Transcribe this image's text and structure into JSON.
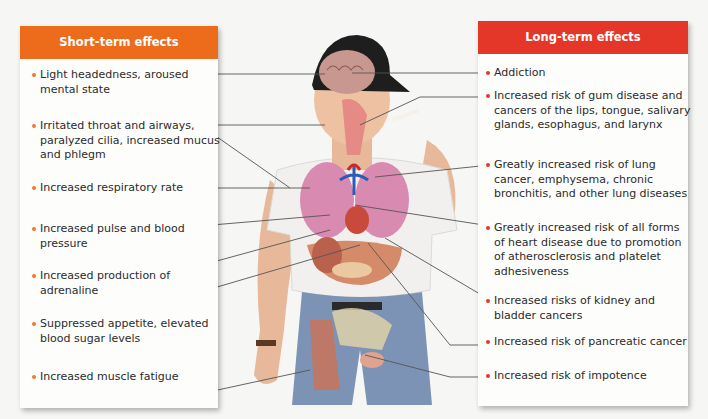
{
  "colors": {
    "short_term_header": "#ec6c1c",
    "long_term_header": "#e4372a",
    "panel_background": "#fdfdfc",
    "page_background": "#f6f6f5",
    "text": "#2b2b2b"
  },
  "short_term": {
    "title": "Short-term effects",
    "items": [
      {
        "label": "Light headedness, aroused mental state",
        "organ": "brain"
      },
      {
        "label": "Irritated throat and airways, paralyzed cilia, increased mucus and phlegm",
        "organ": "throat-airways"
      },
      {
        "label": "Increased respiratory rate",
        "organ": "lungs"
      },
      {
        "label": "Increased pulse and blood pressure",
        "organ": "heart"
      },
      {
        "label": "Increased production of adrenaline",
        "organ": "adrenal-glands"
      },
      {
        "label": "Suppressed appetite, elevated blood sugar levels",
        "organ": "stomach"
      },
      {
        "label": "Increased muscle fatigue",
        "organ": "muscles"
      }
    ]
  },
  "long_term": {
    "title": "Long-term effects",
    "items": [
      {
        "label": "Addiction",
        "organ": "brain"
      },
      {
        "label": "Increased risk of gum disease and cancers of the lips, tongue, salivary glands, esophagus, and larynx",
        "organ": "mouth"
      },
      {
        "label": "Greatly increased risk of lung cancer, emphysema, chronic bronchitis, and other lung diseases",
        "organ": "lungs"
      },
      {
        "label": "Greatly increased risk of all forms of heart disease due to promotion of atherosclerosis and platelet adhesiveness",
        "organ": "heart"
      },
      {
        "label": "Increased risks of kidney and bladder cancers",
        "organ": "kidney"
      },
      {
        "label": "Increased risk of pancreatic cancer",
        "organ": "pancreas"
      },
      {
        "label": "Increased risk of impotence",
        "organ": "reproductive-organs"
      }
    ]
  },
  "figure": {
    "visible_organs": [
      "brain",
      "mouth-throat",
      "lungs",
      "heart",
      "stomach",
      "liver",
      "pancreas",
      "kidney",
      "leg-muscles",
      "reproductive-organs"
    ]
  }
}
